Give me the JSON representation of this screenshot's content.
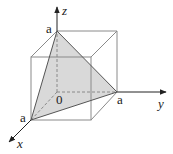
{
  "diagram": {
    "type": "3d-coordinate-cube-with-tetrahedron",
    "colors": {
      "background": "#ffffff",
      "axis": "#222222",
      "cube_edge": "#8a8a8a",
      "hidden_edge": "#8a8a8a",
      "face_fill": "#d9d9d9",
      "text": "#222222"
    },
    "axes": {
      "x": {
        "label": "x"
      },
      "y": {
        "label": "y"
      },
      "z": {
        "label": "z"
      }
    },
    "origin_label": "0",
    "points": {
      "z_intercept": "a",
      "y_intercept": "a",
      "x_intercept": "a"
    }
  }
}
